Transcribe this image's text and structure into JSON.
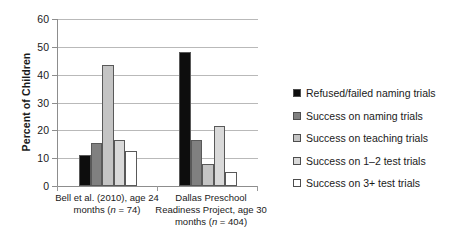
{
  "chart_data": {
    "type": "bar",
    "title": "",
    "xlabel": "",
    "ylabel": "Percent of Children",
    "ylim": [
      0,
      60
    ],
    "yticks": [
      0,
      10,
      20,
      30,
      40,
      50,
      60
    ],
    "grid": true,
    "legend_position": "right",
    "categories": [
      "Bell et al. (2010), age 24 months (n = 74)",
      "Dallas Preschool Readiness Project, age 30 months (n = 404)"
    ],
    "series": [
      {
        "name": "Refused/failed naming trials",
        "values": [
          11,
          48
        ],
        "color": "#0d0d0d"
      },
      {
        "name": "Success on naming trials",
        "values": [
          15.5,
          16.5
        ],
        "color": "#808080"
      },
      {
        "name": "Success on teaching trials",
        "values": [
          43.5,
          8
        ],
        "color": "#c4c4c4"
      },
      {
        "name": "Success on 1–2 test trials",
        "values": [
          16.5,
          21.5
        ],
        "color": "#d9d9d9"
      },
      {
        "name": "Success on 3+ test trials",
        "values": [
          12.5,
          5
        ],
        "color": "#ffffff"
      }
    ]
  },
  "axis": {
    "y_title": "Percent of Children",
    "y_tick_labels": [
      "60",
      "50",
      "40",
      "30",
      "20",
      "10",
      "0"
    ],
    "x_labels": [
      {
        "line1": "Bell et al. (2010), age 24",
        "line2": "months (n = 74)"
      },
      {
        "line1": "Dallas Preschool",
        "line2": "Readiness Project, age 30",
        "line3": "months (n = 404)"
      }
    ]
  },
  "legend": {
    "items": [
      {
        "label": "Refused/failed naming trials",
        "color": "#0d0d0d"
      },
      {
        "label": "Success on naming trials",
        "color": "#808080"
      },
      {
        "label": "Success on teaching trials",
        "color": "#c4c4c4"
      },
      {
        "label": "Success on 1–2 test trials",
        "color": "#d9d9d9"
      },
      {
        "label": "Success on 3+ test trials",
        "color": "#ffffff"
      }
    ]
  }
}
